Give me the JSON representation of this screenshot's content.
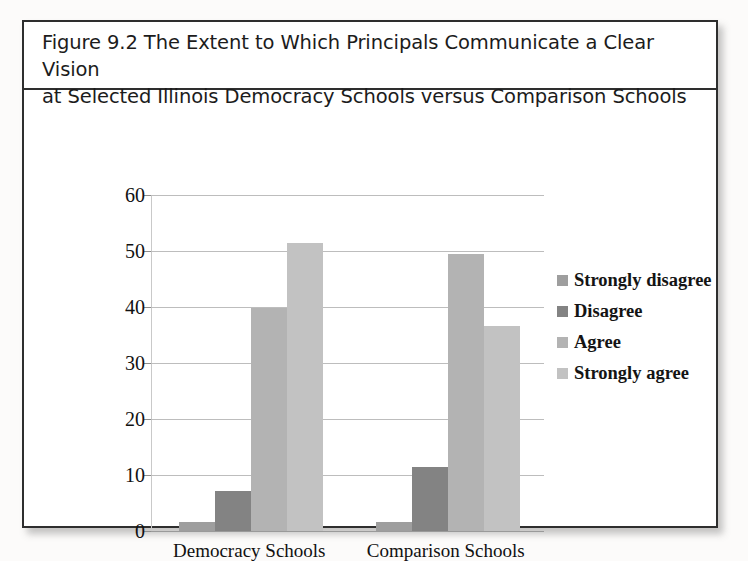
{
  "figure": {
    "title_line1": "Figure 9.2 The Extent to Which Principals Communicate a Clear Vision",
    "title_line2": "at Selected Illinois Democracy Schools versus Comparison Schools"
  },
  "chart_data": {
    "type": "bar",
    "title": "Figure 9.2 The Extent to Which Principals Communicate a Clear Vision at Selected Illinois Democracy Schools versus Comparison Schools",
    "xlabel": "",
    "ylabel": "",
    "ylim": [
      0,
      60
    ],
    "yticks": [
      0,
      10,
      20,
      30,
      40,
      50,
      60
    ],
    "ytick_labels": [
      "0",
      "10",
      "20",
      "30",
      "40",
      "50",
      "60"
    ],
    "grid": true,
    "legend_position": "right",
    "categories": [
      "Democracy Schools",
      "Comparison Schools"
    ],
    "series": [
      {
        "name": "Strongly disagree",
        "color": "#9e9e9e",
        "values": [
          1.6,
          1.6
        ]
      },
      {
        "name": "Disagree",
        "color": "#838383",
        "values": [
          7.2,
          11.5
        ]
      },
      {
        "name": "Agree",
        "color": "#b3b3b3",
        "values": [
          39.8,
          49.4
        ]
      },
      {
        "name": "Strongly agree",
        "color": "#c2c2c2",
        "values": [
          51.4,
          36.6
        ]
      }
    ]
  }
}
